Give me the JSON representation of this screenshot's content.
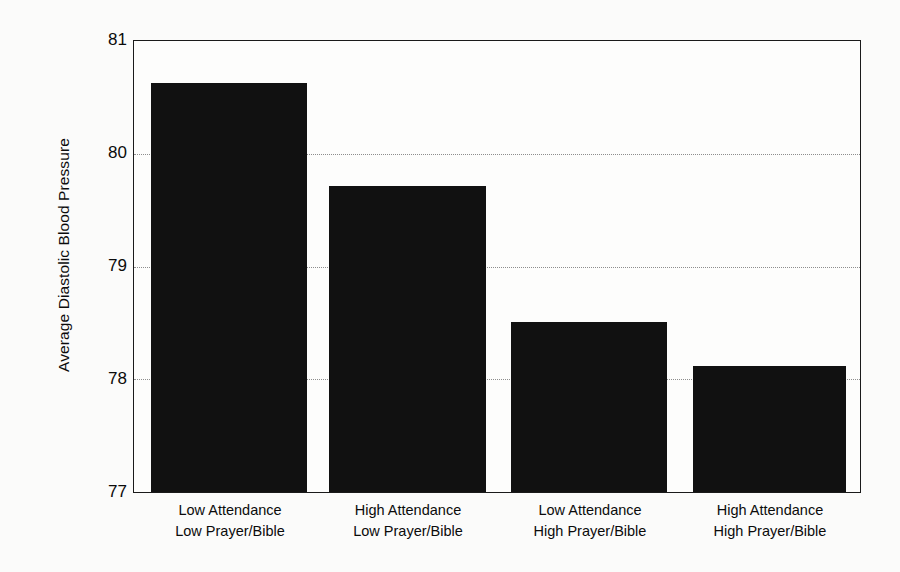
{
  "chart_data": {
    "type": "bar",
    "title": "",
    "subtitle": "",
    "xlabel": "",
    "ylabel": "Average Diastolic Blood Pressure",
    "ylim": [
      77,
      81
    ],
    "yticks": [
      77,
      78,
      79,
      80,
      81
    ],
    "ytick_labels": [
      "77",
      "78",
      "79",
      "80",
      "81"
    ],
    "grid": true,
    "grid_axis": "y",
    "legend": false,
    "legend_position": "none",
    "bar_color": "#111111",
    "categories": [
      "Low Attendance Low Prayer/Bible",
      "High Attendance Low Prayer/Bible",
      "Low Attendance High Prayer/Bible",
      "High Attendance High Prayer/Bible"
    ],
    "category_lines": [
      {
        "line1": "Low Attendance",
        "line2": "Low Prayer/Bible"
      },
      {
        "line1": "High Attendance",
        "line2": "Low Prayer/Bible"
      },
      {
        "line1": "Low Attendance",
        "line2": "High Prayer/Bible"
      },
      {
        "line1": "High Attendance",
        "line2": "High Prayer/Bible"
      }
    ],
    "values": [
      80.63,
      79.71,
      78.51,
      78.12
    ]
  }
}
